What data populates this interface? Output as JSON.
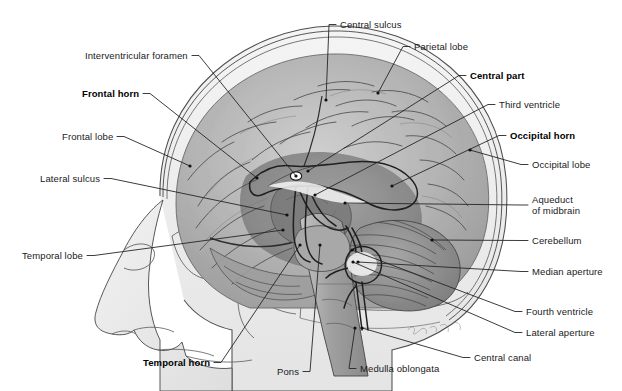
{
  "figure": {
    "background_color": "#ffffff",
    "text_color": "#1a1a1a",
    "leader_color": "#262626",
    "signature": "artist-signature"
  },
  "palette": {
    "skull_fill": "#e9e9e9",
    "scalp_fill": "#efefef",
    "brain_light": "#c9c9c9",
    "brain_mid": "#ababab",
    "brain_dark": "#8d8d8d",
    "brain_deep": "#6f6f6f",
    "ventricle_fill": "#ffffff",
    "outline": "#4a4a4a",
    "sulcus": "#3a3a3a"
  },
  "labels": [
    {
      "id": "central-sulcus",
      "text": "Central sulcus",
      "bold": false,
      "x": 340,
      "y": 19,
      "align": "left",
      "tip_x": 326,
      "tip_y": 100
    },
    {
      "id": "parietal-lobe",
      "text": "Parietal lobe",
      "bold": false,
      "x": 414,
      "y": 41,
      "align": "left",
      "tip_x": 378,
      "tip_y": 93
    },
    {
      "id": "central-part",
      "text": "Central part",
      "bold": true,
      "x": 470,
      "y": 70,
      "align": "left",
      "tip_x": 308,
      "tip_y": 171
    },
    {
      "id": "third-ventricle",
      "text": "Third ventricle",
      "bold": false,
      "x": 499,
      "y": 99,
      "align": "left",
      "tip_x": 315,
      "tip_y": 195
    },
    {
      "id": "occipital-horn",
      "text": "Occipital horn",
      "bold": true,
      "x": 510,
      "y": 130,
      "align": "left",
      "tip_x": 392,
      "tip_y": 186
    },
    {
      "id": "occipital-lobe",
      "text": "Occipital lobe",
      "bold": false,
      "x": 532,
      "y": 159,
      "align": "left",
      "tip_x": 470,
      "tip_y": 150
    },
    {
      "id": "aqueduct-of-midbrain",
      "text": "Aqueduct\nof midbrain",
      "bold": false,
      "x": 532,
      "y": 194,
      "align": "left",
      "tip_x": 345,
      "tip_y": 203
    },
    {
      "id": "cerebellum",
      "text": "Cerebellum",
      "bold": false,
      "x": 532,
      "y": 235,
      "align": "left",
      "tip_x": 432,
      "tip_y": 240
    },
    {
      "id": "median-aperture",
      "text": "Median aperture",
      "bold": false,
      "x": 532,
      "y": 266,
      "align": "left",
      "tip_x": 358,
      "tip_y": 262
    },
    {
      "id": "fourth-ventricle",
      "text": "Fourth ventricle",
      "bold": false,
      "x": 526,
      "y": 306,
      "align": "left",
      "tip_x": 352,
      "tip_y": 250
    },
    {
      "id": "lateral-aperture",
      "text": "Lateral aperture",
      "bold": false,
      "x": 526,
      "y": 327,
      "align": "left",
      "tip_x": 353,
      "tip_y": 262
    },
    {
      "id": "central-canal",
      "text": "Central canal",
      "bold": false,
      "x": 474,
      "y": 352,
      "align": "left",
      "tip_x": 362,
      "tip_y": 328
    },
    {
      "id": "medulla-oblongata",
      "text": "Medulla oblongata",
      "bold": false,
      "x": 360,
      "y": 363,
      "align": "left",
      "tip_x": 355,
      "tip_y": 328
    },
    {
      "id": "pons",
      "text": "Pons",
      "bold": false,
      "x": 277,
      "y": 366,
      "align": "left",
      "tip_x": 320,
      "tip_y": 245
    },
    {
      "id": "temporal-horn",
      "text": "Temporal horn",
      "bold": true,
      "x": 143,
      "y": 357,
      "align": "left",
      "tip_x": 300,
      "tip_y": 245
    },
    {
      "id": "temporal-lobe",
      "text": "Temporal lobe",
      "bold": false,
      "x": 22,
      "y": 250,
      "align": "left",
      "tip_x": 283,
      "tip_y": 230
    },
    {
      "id": "lateral-sulcus",
      "text": "Lateral sulcus",
      "bold": false,
      "x": 40,
      "y": 173,
      "align": "left",
      "tip_x": 287,
      "tip_y": 215
    },
    {
      "id": "frontal-lobe",
      "text": "Frontal lobe",
      "bold": false,
      "x": 62,
      "y": 131,
      "align": "left",
      "tip_x": 190,
      "tip_y": 166
    },
    {
      "id": "frontal-horn",
      "text": "Frontal horn",
      "bold": true,
      "x": 82,
      "y": 88,
      "align": "left",
      "tip_x": 257,
      "tip_y": 178
    },
    {
      "id": "interventricular-foramen",
      "text": "Interventricular foramen",
      "bold": false,
      "x": 85,
      "y": 50,
      "align": "left",
      "tip_x": 296,
      "tip_y": 176
    }
  ]
}
